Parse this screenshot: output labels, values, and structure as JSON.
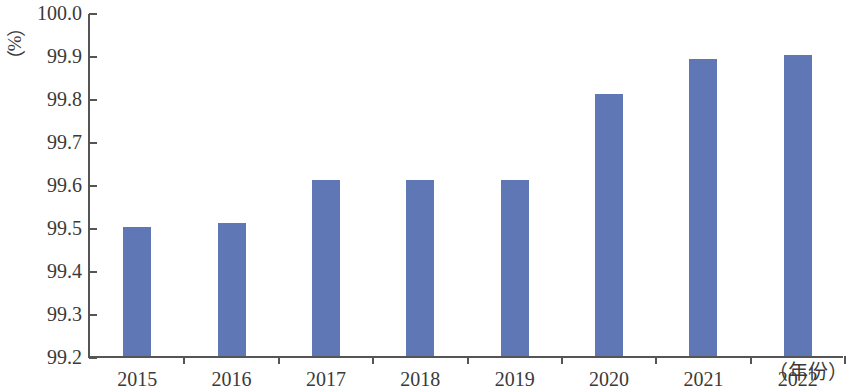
{
  "axes": {
    "y_unit_label": "（%）",
    "x_unit_label": "（年份）",
    "y_ticks": [
      "100.0",
      "99.9",
      "99.8",
      "99.7",
      "99.6",
      "99.5",
      "99.4",
      "99.3",
      "99.2"
    ]
  },
  "style": {
    "bar_color": "#6077b5",
    "axis_color": "#555555",
    "text_color": "#3a3a3a",
    "background": "#ffffff"
  },
  "chart_data": {
    "type": "bar",
    "title": "",
    "subtitle": "",
    "xlabel": "（年份）",
    "ylabel": "（%）",
    "categories": [
      "2015",
      "2016",
      "2017",
      "2018",
      "2019",
      "2020",
      "2021",
      "2022"
    ],
    "values": [
      99.5,
      99.51,
      99.61,
      99.61,
      99.61,
      99.81,
      99.89,
      99.9
    ],
    "series": [
      {
        "name": "",
        "values": [
          99.5,
          99.51,
          99.61,
          99.61,
          99.61,
          99.81,
          99.89,
          99.9
        ]
      }
    ],
    "ylim": [
      99.2,
      100.0
    ],
    "ytick_step": 0.1,
    "ytick_labels": [
      "99.2",
      "99.3",
      "99.4",
      "99.5",
      "99.6",
      "99.7",
      "99.8",
      "99.9",
      "100.0"
    ],
    "grid": false,
    "legend": false,
    "legend_position": "none",
    "annotations": []
  }
}
